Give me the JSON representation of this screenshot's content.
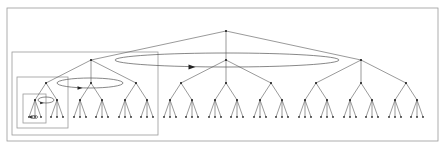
{
  "diagram": {
    "type": "tree",
    "levels": [
      {
        "level": 0,
        "branching": 3
      },
      {
        "level": 1,
        "branching": 3
      },
      {
        "level": 2,
        "branching": 2
      },
      {
        "level": 3,
        "branching": 3
      }
    ],
    "nested_boxes": 3,
    "loops": 3,
    "colors": {
      "frame": "#9a9a9a",
      "edge": "#555555",
      "node": "#222222"
    }
  }
}
